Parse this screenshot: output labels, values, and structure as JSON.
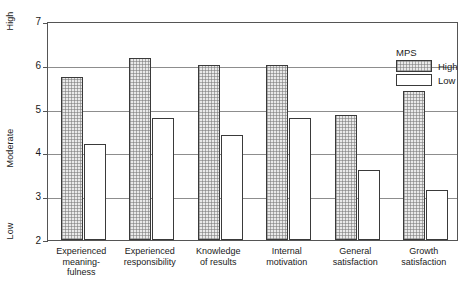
{
  "chart_data": {
    "type": "bar",
    "title": "",
    "xlabel": "",
    "ylabel": "",
    "ylim": [
      2,
      7
    ],
    "yticks": [
      2,
      3,
      4,
      5,
      6,
      7
    ],
    "ytick_labels": [
      "2",
      "3",
      "4",
      "5",
      "6",
      "7"
    ],
    "y_region_labels": [
      {
        "text": "High",
        "value": 7
      },
      {
        "text": "Moderate",
        "value": 4.1
      },
      {
        "text": "Low",
        "value": 2.2
      }
    ],
    "grid": true,
    "grid_axis": "y",
    "legend": {
      "title": "MPS",
      "position": "top-right",
      "entries": [
        {
          "label": "High",
          "fill": "hatched"
        },
        {
          "label": "Low",
          "fill": "white"
        }
      ]
    },
    "categories": [
      "Experienced\nmeaning-\nfulness",
      "Experienced\nresponsibility",
      "Knowledge\nof results",
      "Internal\nmotivation",
      "General\nsatisfaction",
      "Growth\nsatisfaction"
    ],
    "series": [
      {
        "name": "High",
        "values": [
          5.72,
          6.15,
          6.0,
          6.0,
          4.85,
          5.4
        ]
      },
      {
        "name": "Low",
        "values": [
          4.2,
          4.78,
          4.4,
          4.78,
          3.6,
          3.15
        ]
      }
    ]
  },
  "colors": {
    "bar_outline": "#3a3a3a",
    "high_fill": "#e9e9e9",
    "low_fill": "#ffffff",
    "gridline": "#8d8d8d",
    "frame": "#555555",
    "text": "#1a1a1a"
  }
}
